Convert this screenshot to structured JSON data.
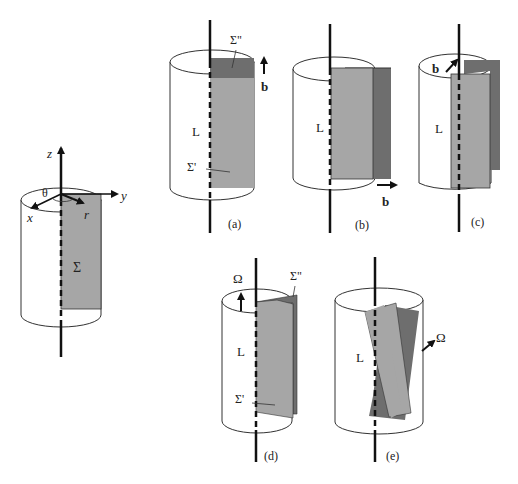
{
  "colors": {
    "background": "#ffffff",
    "stroke": "#111111",
    "outline": "#333333",
    "light_sheet": "#a6a6a6",
    "dark_sheet": "#6e6e6e"
  },
  "main_figure": {
    "axis_labels": {
      "z": "z",
      "y": "y",
      "x": "x",
      "r": "r",
      "theta": "θ"
    },
    "surface_label": "Σ"
  },
  "panels": [
    {
      "id": "a",
      "caption": "(a)",
      "line_label": "L",
      "upper_label": "Σ\"",
      "lower_label": "Σ'",
      "vector_label": "b"
    },
    {
      "id": "b",
      "caption": "(b)",
      "line_label": "L",
      "vector_label": "b"
    },
    {
      "id": "c",
      "caption": "(c)",
      "line_label": "L",
      "vector_label": "b"
    },
    {
      "id": "d",
      "caption": "(d)",
      "line_label": "L",
      "upper_label": "Σ\"",
      "lower_label": "Σ'",
      "vector_label": "Ω"
    },
    {
      "id": "e",
      "caption": "(e)",
      "line_label": "L",
      "vector_label": "Ω"
    }
  ]
}
